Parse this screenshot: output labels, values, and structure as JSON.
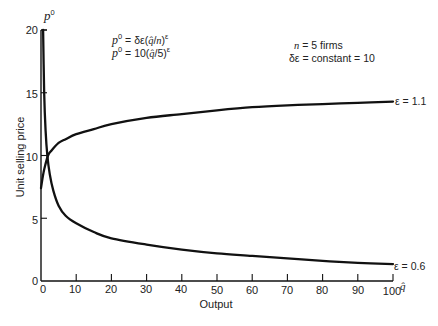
{
  "chart_data": {
    "type": "line",
    "title": "",
    "xlabel": "Output",
    "xlabel_symbol": "q̂",
    "ylabel": "Unit selling price",
    "ylabel_symbol": {
      "base": "p",
      "sup": "0"
    },
    "xlim": [
      0,
      100
    ],
    "ylim": [
      0,
      20
    ],
    "grid": false,
    "legend": "inline labels at right end of curves",
    "x_ticks": [
      0,
      10,
      20,
      30,
      40,
      50,
      60,
      70,
      80,
      90,
      100
    ],
    "y_ticks": [
      0,
      5,
      10,
      15,
      20
    ],
    "series": [
      {
        "name": "ε = 1.1",
        "points": [
          [
            0,
            7.4
          ],
          [
            0.5,
            8.3
          ],
          [
            1,
            9.0
          ],
          [
            2,
            10.0
          ],
          [
            3,
            10.4
          ],
          [
            5,
            11.0
          ],
          [
            7,
            11.3
          ],
          [
            10,
            11.7
          ],
          [
            15,
            12.1
          ],
          [
            20,
            12.5
          ],
          [
            30,
            13.0
          ],
          [
            40,
            13.3
          ],
          [
            50,
            13.6
          ],
          [
            60,
            13.85
          ],
          [
            70,
            14.0
          ],
          [
            80,
            14.1
          ],
          [
            90,
            14.2
          ],
          [
            100,
            14.3
          ]
        ]
      },
      {
        "name": "ε = 0.6",
        "points": [
          [
            0.6,
            20
          ],
          [
            0.9,
            15
          ],
          [
            1.3,
            12
          ],
          [
            1.8,
            10
          ],
          [
            2.5,
            8.5
          ],
          [
            3.5,
            7.2
          ],
          [
            5,
            6.0
          ],
          [
            7,
            5.2
          ],
          [
            10,
            4.6
          ],
          [
            15,
            3.9
          ],
          [
            20,
            3.4
          ],
          [
            30,
            2.9
          ],
          [
            40,
            2.5
          ],
          [
            50,
            2.2
          ],
          [
            60,
            2.0
          ],
          [
            70,
            1.8
          ],
          [
            80,
            1.6
          ],
          [
            90,
            1.45
          ],
          [
            100,
            1.35
          ]
        ]
      }
    ],
    "annotations": {
      "formula_general": "p⁰ = δε(q̂/n)^ε",
      "formula_specific": "p⁰ = 10(q̂/5)^ε",
      "params_line1": "n = 5 firms",
      "params_line2": "δε = constant = 10"
    }
  },
  "labels": {
    "y_symbol_base": "p",
    "y_symbol_sup": "0",
    "y_title": "Unit selling price",
    "x_title": "Output",
    "x_symbol": "q̂",
    "y_ticks": [
      "0",
      "5",
      "10",
      "15",
      "20"
    ],
    "x_ticks": [
      "0",
      "10",
      "20",
      "30",
      "40",
      "50",
      "60",
      "70",
      "80",
      "90",
      "100"
    ],
    "series_label_1": "ε = 1.1",
    "series_label_2": "ε = 0.6"
  },
  "formula1": {
    "p": "p",
    "p_sup": "0",
    "eq": " = δε(",
    "q": "q̂",
    "slash": "/",
    "n": "n",
    "close": ")",
    "exp": "ε"
  },
  "formula2": {
    "p": "p",
    "p_sup": "0",
    "eq": " = 10(",
    "q": "q̂",
    "rest": "/5)",
    "exp": "ε"
  },
  "params": {
    "n_sym": "n",
    "n_rest": " = 5 firms",
    "line2": "δε = constant = 10"
  }
}
